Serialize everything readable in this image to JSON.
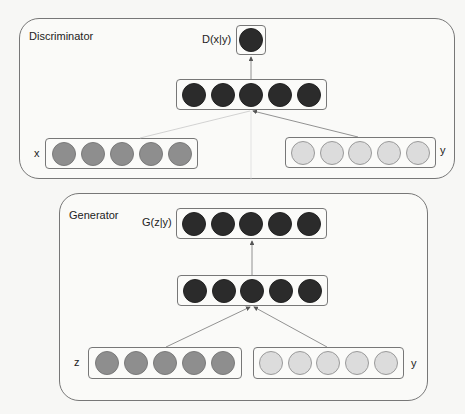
{
  "colors": {
    "background": "#f7f7f5",
    "border": "#777777",
    "node_dark": "#2b2b2b",
    "node_mid": "#8e8e8e",
    "node_light": "#dcdcdc"
  },
  "discriminator": {
    "title": "Discriminator",
    "output_label": "D(x|y)",
    "output_nodes": 1,
    "hidden_nodes": 5,
    "input_x": {
      "label": "x",
      "nodes": 5
    },
    "input_y": {
      "label": "y",
      "nodes": 5
    }
  },
  "generator": {
    "title": "Generator",
    "output_label": "G(z|y)",
    "output_nodes": 5,
    "hidden_nodes": 5,
    "input_z": {
      "label": "z",
      "nodes": 5
    },
    "input_y": {
      "label": "y",
      "nodes": 5
    }
  }
}
